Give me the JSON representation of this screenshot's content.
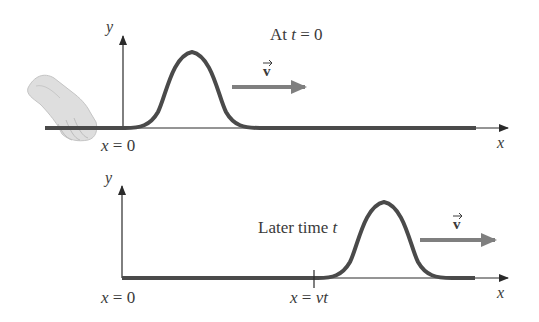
{
  "diagram": {
    "colors": {
      "rope": "#4a4a4a",
      "axis": "#2a2a2a",
      "arrow": "#7f7f7f",
      "text": "#3a3a3a",
      "hand": "#d9d9d9"
    },
    "top_panel": {
      "caption": "At t = 0",
      "caption_parts": {
        "prefix": "At ",
        "var": "t",
        "suffix": " = 0"
      },
      "y_axis_label": "y",
      "x_axis_label": "x",
      "origin_label": "x = 0",
      "origin_parts": {
        "var": "x",
        "rest": " = 0"
      },
      "velocity_label": "v",
      "pulse_center_x": 192,
      "has_hand": true
    },
    "bottom_panel": {
      "caption": "Later time t",
      "caption_parts": {
        "prefix": "Later time ",
        "var": "t"
      },
      "y_axis_label": "y",
      "x_axis_label": "x",
      "origin_label": "x = 0",
      "origin_parts": {
        "var": "x",
        "rest": " = 0"
      },
      "tick_label": "x = vt",
      "tick_parts": {
        "var": "x",
        "eq": " = ",
        "rhs": "vt"
      },
      "velocity_label": "v",
      "pulse_center_x": 383
    }
  }
}
